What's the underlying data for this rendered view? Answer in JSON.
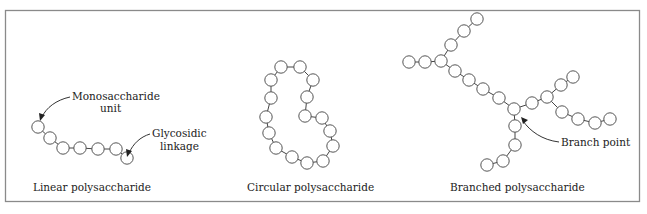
{
  "panels": [
    {
      "id": "linear",
      "caption": "Linear polysaccharide",
      "unit_count": 7,
      "callouts": [
        {
          "id": "monosaccharide",
          "lines": [
            "Monosaccharide",
            "unit"
          ]
        },
        {
          "id": "glycosidic",
          "lines": [
            "Glycosidic",
            "linkage"
          ]
        }
      ]
    },
    {
      "id": "circular",
      "caption": "Circular polysaccharide",
      "unit_count": 16
    },
    {
      "id": "branched",
      "caption": "Branched polysaccharide",
      "unit_count": 24,
      "callouts": [
        {
          "id": "branch-point",
          "lines": [
            "Branch point"
          ]
        }
      ]
    }
  ],
  "colors": {
    "frame": "#8a8a8a",
    "unit_stroke": "#555555",
    "text": "#222222"
  }
}
